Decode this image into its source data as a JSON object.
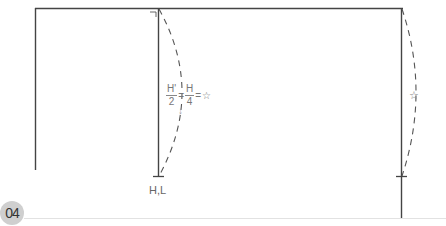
{
  "figure": {
    "step_number": "04",
    "colors": {
      "line": "#444444",
      "dashed": "#555555",
      "text": "#666666",
      "badge_bg": "#cfcfcf"
    }
  },
  "annotations": {
    "formula": {
      "frac1_num": "H'",
      "frac1_den": "2",
      "eq1": "=",
      "frac2_num": "H",
      "frac2_den": "4",
      "eq2": "=",
      "result": "☆"
    },
    "arrow": "↓",
    "hl_label": "H,L",
    "right_star": "☆"
  }
}
